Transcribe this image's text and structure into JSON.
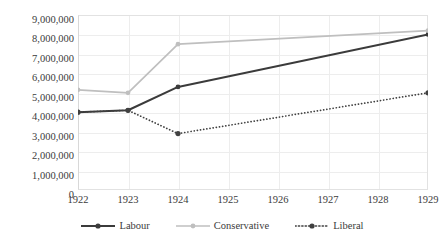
{
  "chart_data": {
    "type": "line",
    "title": "",
    "subtitle": "",
    "xlabel": "",
    "ylabel": "",
    "x": [
      1922,
      1923,
      1924,
      1929
    ],
    "categories": [
      "1922",
      "1923",
      "1924",
      "1925",
      "1926",
      "1927",
      "1928",
      "1929"
    ],
    "xlim": [
      1922,
      1929
    ],
    "ylim": [
      0,
      9000000
    ],
    "ytick_values": [
      0,
      1000000,
      2000000,
      3000000,
      4000000,
      5000000,
      6000000,
      7000000,
      8000000,
      9000000
    ],
    "ytick_labels": [
      "0",
      "1,000,000",
      "2,000,000",
      "3,000,000",
      "4,000,000",
      "5,000,000",
      "6,000,000",
      "7,000,000",
      "8,000,000",
      "9,000,000"
    ],
    "grid": true,
    "legend_position": "bottom",
    "series": [
      {
        "name": "Labour",
        "color": "#3b3b3b",
        "style": "solid",
        "marker": "circle",
        "x": [
          1922,
          1923,
          1924,
          1929
        ],
        "values": [
          4000000,
          4100000,
          5300000,
          8000000
        ]
      },
      {
        "name": "Conservative",
        "color": "#bfbfbf",
        "style": "solid",
        "marker": "circle",
        "x": [
          1922,
          1923,
          1924,
          1929
        ],
        "values": [
          5150000,
          5000000,
          7500000,
          8200000
        ]
      },
      {
        "name": "Liberal",
        "color": "#404040",
        "style": "dotted",
        "marker": "circle",
        "x": [
          1922,
          1923,
          1924,
          1929
        ],
        "values": [
          4000000,
          4100000,
          2900000,
          5000000
        ]
      }
    ]
  },
  "yticks": {
    "t9": "9,000,000",
    "t8": "8,000,000",
    "t7": "7,000,000",
    "t6": "6,000,000",
    "t5": "5,000,000",
    "t4": "4,000,000",
    "t3": "3,000,000",
    "t2": "2,000,000",
    "t1": "1,000,000",
    "t0": "0"
  },
  "xticks": {
    "x1922": "1922",
    "x1923": "1923",
    "x1924": "1924",
    "x1925": "1925",
    "x1926": "1926",
    "x1927": "1927",
    "x1928": "1928",
    "x1929": "1929"
  },
  "legend": {
    "labour": "Labour",
    "conservative": "Conservative",
    "liberal": "Liberal"
  },
  "colors": {
    "labour": "#3b3b3b",
    "conservative": "#bfbfbf",
    "liberal": "#404040",
    "grid": "#ededed",
    "frame": "#e2e2e2",
    "text": "#3b3b3b",
    "background": "#ffffff"
  }
}
